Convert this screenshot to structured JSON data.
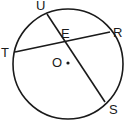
{
  "diagram": {
    "type": "circle-intersecting-chords",
    "circle": {
      "center_label": "O",
      "cx": 68,
      "cy": 64,
      "r": 55
    },
    "stroke_color": "#1a1a1a",
    "points": [
      {
        "id": "U",
        "label": "U",
        "x": 47,
        "y": 14,
        "lx": 36,
        "ly": 10
      },
      {
        "id": "R",
        "label": "R",
        "x": 110,
        "y": 32,
        "lx": 113,
        "ly": 37
      },
      {
        "id": "T",
        "label": "T",
        "x": 15,
        "y": 52,
        "lx": 1,
        "ly": 57
      },
      {
        "id": "S",
        "label": "S",
        "x": 105,
        "y": 102,
        "lx": 109,
        "ly": 114
      },
      {
        "id": "E",
        "label": "E",
        "x": 63,
        "y": 42,
        "lx": 61,
        "ly": 38
      },
      {
        "id": "O",
        "label": "O",
        "x": 68,
        "y": 63,
        "lx": 52,
        "ly": 67
      }
    ],
    "chords": [
      {
        "from": "T",
        "to": "R"
      },
      {
        "from": "U",
        "to": "S"
      }
    ]
  }
}
